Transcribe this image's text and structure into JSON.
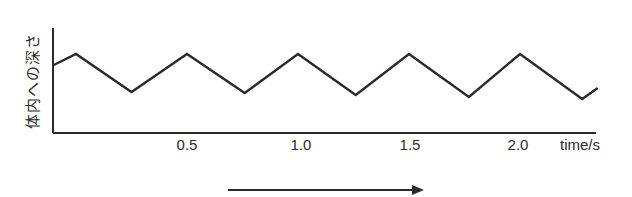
{
  "chart_data": {
    "type": "line",
    "title": "",
    "xlabel": "time/s",
    "ylabel": "体内への深さ",
    "x_ticks": [
      "0.5",
      "1.0",
      "1.5",
      "2.0"
    ],
    "x_tick_values": [
      0.5,
      1.0,
      1.5,
      2.0
    ],
    "xlim": [
      -0.1,
      2.4
    ],
    "y_ticks": [],
    "y_units": "relative depth (unlabeled)",
    "grid": false,
    "legend": null,
    "annotations": [
      "right-pointing arrow below x-axis indicating time direction"
    ],
    "series": [
      {
        "name": "depth",
        "x": [
          -0.1,
          0.0,
          0.25,
          0.5,
          0.76,
          1.0,
          1.26,
          1.5,
          1.77,
          2.0,
          2.28,
          2.35
        ],
        "values": [
          68,
          79,
          41,
          79,
          40,
          79,
          38,
          79,
          36,
          79,
          34,
          45
        ]
      }
    ]
  },
  "axes": {
    "x_label": "time/s",
    "y_label": "体内への深さ",
    "ticks": [
      {
        "label": "0.5",
        "px": 187
      },
      {
        "label": "1.0",
        "px": 301
      },
      {
        "label": "1.5",
        "px": 410
      },
      {
        "label": "2.0",
        "px": 518
      }
    ]
  },
  "colors": {
    "line": "#2a2a2a",
    "background": "#ffffff"
  }
}
